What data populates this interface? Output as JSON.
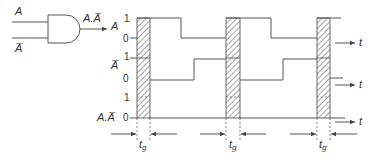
{
  "gate": {
    "type": "AND",
    "input_a_label": "A",
    "input_b_label": "A̅",
    "output_label": "A.A̅"
  },
  "signals": [
    {
      "name": "A",
      "level_high": "1",
      "level_low": "0",
      "sequence": [
        "0",
        "glitch",
        "1",
        "0",
        "glitch",
        "1",
        "0",
        "glitch",
        "1"
      ]
    },
    {
      "name": "A̅",
      "level_high": "1",
      "level_low": "0",
      "sequence": [
        "1",
        "glitch",
        "0",
        "1",
        "glitch",
        "0",
        "1",
        "glitch",
        "0"
      ]
    },
    {
      "name": "A.A̅",
      "level_high": "1",
      "level_low": "0",
      "sequence": [
        "0",
        "glitch",
        "0",
        "0",
        "glitch",
        "0",
        "0",
        "glitch",
        "0"
      ]
    }
  ],
  "time_axis_label": "t",
  "gate_delay": {
    "label": "t",
    "subscript": "g",
    "count": 3
  }
}
